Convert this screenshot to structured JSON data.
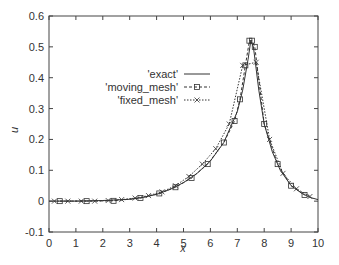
{
  "chart_data": {
    "type": "line",
    "title": "",
    "xlabel": "x",
    "ylabel": "u",
    "xlim": [
      0,
      10
    ],
    "ylim": [
      -0.1,
      0.6
    ],
    "xticks": [
      "0",
      "1",
      "2",
      "3",
      "4",
      "5",
      "6",
      "7",
      "8",
      "9",
      "10"
    ],
    "yticks": [
      "-0.1",
      "0",
      "0.1",
      "0.2",
      "0.3",
      "0.4",
      "0.5",
      "0.6"
    ],
    "grid": false,
    "legend_position": "upper-left-center",
    "series": [
      {
        "name": "'exact'",
        "style": "solid",
        "marker": "none",
        "x": [
          0,
          1,
          2,
          3,
          3.5,
          4,
          4.5,
          5,
          5.5,
          6,
          6.5,
          7,
          7.2,
          7.4,
          7.5,
          7.6,
          7.8,
          8,
          8.3,
          8.6,
          9,
          9.4,
          9.7,
          10
        ],
        "y": [
          0,
          0,
          0.002,
          0.006,
          0.012,
          0.022,
          0.038,
          0.06,
          0.09,
          0.13,
          0.19,
          0.29,
          0.36,
          0.46,
          0.52,
          0.5,
          0.36,
          0.25,
          0.16,
          0.1,
          0.05,
          0.025,
          0.012,
          0.005
        ]
      },
      {
        "name": "'moving_mesh'",
        "style": "dashed",
        "marker": "square",
        "x": [
          0.4,
          1.4,
          2.4,
          3.4,
          4.1,
          4.7,
          5.3,
          5.9,
          6.5,
          6.9,
          7.1,
          7.3,
          7.45,
          7.55,
          7.65,
          8.0,
          8.5,
          9.0,
          9.5
        ],
        "y": [
          0,
          0,
          0.001,
          0.01,
          0.025,
          0.045,
          0.075,
          0.12,
          0.19,
          0.26,
          0.33,
          0.44,
          0.52,
          0.52,
          0.5,
          0.25,
          0.12,
          0.05,
          0.02
        ]
      },
      {
        "name": "'fixed_mesh'",
        "style": "dotted",
        "marker": "x",
        "x": [
          0.2,
          0.7,
          1.2,
          1.7,
          2.2,
          2.7,
          3.2,
          3.7,
          4.2,
          4.7,
          5.2,
          5.7,
          6.2,
          6.7,
          7.2,
          7.7,
          8.2,
          8.7,
          9.2,
          9.7
        ],
        "y": [
          0,
          0,
          0,
          0,
          0.002,
          0.005,
          0.01,
          0.018,
          0.03,
          0.05,
          0.08,
          0.12,
          0.17,
          0.25,
          0.44,
          0.45,
          0.2,
          0.09,
          0.04,
          0.015
        ]
      }
    ]
  },
  "legend": {
    "exact": "'exact'",
    "moving": "'moving_mesh'",
    "fixed": "'fixed_mesh'"
  },
  "axes": {
    "xlabel": "x",
    "ylabel": "u"
  }
}
